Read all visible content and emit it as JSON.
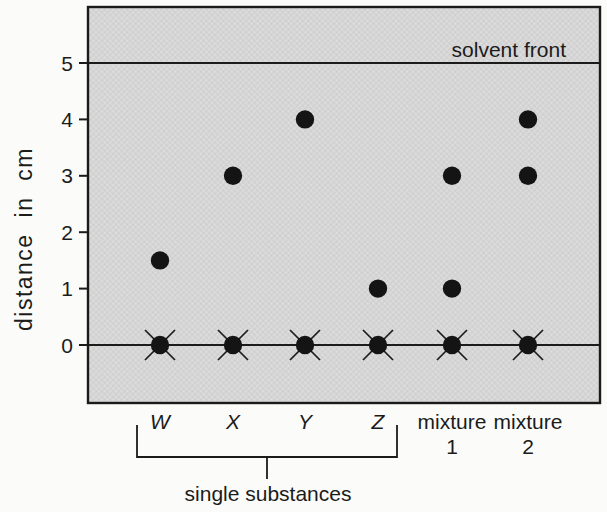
{
  "chart_data": {
    "type": "scatter",
    "ylabel": "distance in cm",
    "ylim": [
      0,
      5
    ],
    "yticks": [
      0,
      1,
      2,
      3,
      4,
      5
    ],
    "solvent_front": {
      "label": "solvent front",
      "y_cm": 5
    },
    "baseline_y_cm": 0,
    "lanes": [
      {
        "label": "W",
        "italic": true,
        "origin_spot_cm": 0,
        "origin_crossed": true,
        "spots_cm": [
          1.5
        ]
      },
      {
        "label": "X",
        "italic": true,
        "origin_spot_cm": 0,
        "origin_crossed": true,
        "spots_cm": [
          3
        ]
      },
      {
        "label": "Y",
        "italic": true,
        "origin_spot_cm": 0,
        "origin_crossed": true,
        "spots_cm": [
          4
        ]
      },
      {
        "label": "Z",
        "italic": true,
        "origin_spot_cm": 0,
        "origin_crossed": true,
        "spots_cm": [
          1
        ]
      },
      {
        "label": "mixture 1",
        "italic": false,
        "origin_spot_cm": 0,
        "origin_crossed": true,
        "spots_cm": [
          1,
          3
        ]
      },
      {
        "label": "mixture 2",
        "italic": false,
        "origin_spot_cm": 0,
        "origin_crossed": true,
        "spots_cm": [
          3,
          4
        ]
      }
    ],
    "bracket": {
      "label": "single substances",
      "covers_lanes": [
        "W",
        "X",
        "Y",
        "Z"
      ]
    }
  },
  "colors": {
    "background": "#fbfbfa",
    "paper": "#d5d5d5",
    "ink": "#1b1b1b",
    "spot": "#141414"
  }
}
